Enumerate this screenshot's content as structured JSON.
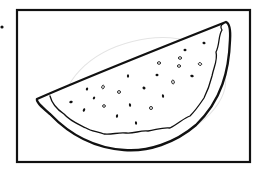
{
  "image": {
    "title": "",
    "subject": "watermelon-slice-line-drawing",
    "width": 262,
    "height": 170,
    "background_color": "#ffffff",
    "ink_color": "#111111",
    "faint_color": "#e4e4e4"
  },
  "frame": {
    "x": 17,
    "y": 10,
    "width": 233,
    "height": 152,
    "stroke_width": 2.2
  },
  "stray_dot": {
    "cx": 2,
    "cy": 27,
    "r": 1.6
  },
  "background_ellipse": {
    "cx": 145,
    "cy": 92,
    "rx": 82,
    "ry": 52,
    "rotate": -14
  },
  "watermelon": {
    "outer_path": "M37,99 C80,80 150,52 226,22 Q231,24 230,40 C229,70 222,100 196,125 C175,143 148,152 124,150 C96,148 70,135 50,114 C42,107 36,102 37,99 Z",
    "inner_rind_path": "M50,96 C52,104 58,110 64,114 C70,121 78,124 86,128 C92,132 98,131 104,134 C112,135 118,132 126,133 C134,134 140,130 148,131 C156,130 162,127 170,128 C178,124 184,118 190,116 C196,110 200,104 204,98 C208,90 210,84 212,76 C214,66 218,60 216,52 C220,44 218,36 222,30 C220,27 221,25 223,24"
  },
  "seeds": [
    {
      "cx": 204,
      "cy": 43,
      "rx": 1.6,
      "ry": 1.2,
      "rot": 20,
      "open": false
    },
    {
      "cx": 185,
      "cy": 50,
      "rx": 1.5,
      "ry": 1.2,
      "rot": 0,
      "open": false
    },
    {
      "cx": 180,
      "cy": 58,
      "rx": 1.6,
      "ry": 1.3,
      "rot": 0,
      "open": true
    },
    {
      "cx": 159,
      "cy": 63,
      "rx": 1.6,
      "ry": 1.3,
      "rot": 0,
      "open": true
    },
    {
      "cx": 179,
      "cy": 66,
      "rx": 1.6,
      "ry": 1.3,
      "rot": 0,
      "open": true
    },
    {
      "cx": 200,
      "cy": 64,
      "rx": 1.7,
      "ry": 1.3,
      "rot": 20,
      "open": true
    },
    {
      "cx": 128,
      "cy": 76,
      "rx": 1.1,
      "ry": 1.8,
      "rot": 0,
      "open": false
    },
    {
      "cx": 157,
      "cy": 75,
      "rx": 1.5,
      "ry": 1.2,
      "rot": 0,
      "open": false
    },
    {
      "cx": 192,
      "cy": 76,
      "rx": 1.8,
      "ry": 1.2,
      "rot": 20,
      "open": false
    },
    {
      "cx": 173,
      "cy": 82,
      "rx": 1.3,
      "ry": 1.9,
      "rot": -10,
      "open": true
    },
    {
      "cx": 144,
      "cy": 88,
      "rx": 1.6,
      "ry": 1.3,
      "rot": 30,
      "open": false
    },
    {
      "cx": 87,
      "cy": 89,
      "rx": 1.1,
      "ry": 1.6,
      "rot": 20,
      "open": false
    },
    {
      "cx": 103,
      "cy": 87,
      "rx": 1.2,
      "ry": 1.8,
      "rot": 15,
      "open": true
    },
    {
      "cx": 119,
      "cy": 92,
      "rx": 1.5,
      "ry": 1.4,
      "rot": 0,
      "open": true
    },
    {
      "cx": 163,
      "cy": 96,
      "rx": 1.1,
      "ry": 1.8,
      "rot": -10,
      "open": false
    },
    {
      "cx": 94,
      "cy": 98,
      "rx": 1.1,
      "ry": 1.5,
      "rot": 30,
      "open": false
    },
    {
      "cx": 71,
      "cy": 102,
      "rx": 1.8,
      "ry": 1.2,
      "rot": -20,
      "open": false
    },
    {
      "cx": 104,
      "cy": 106,
      "rx": 1.4,
      "ry": 1.3,
      "rot": 0,
      "open": true
    },
    {
      "cx": 130,
      "cy": 105,
      "rx": 1.1,
      "ry": 1.8,
      "rot": -10,
      "open": false
    },
    {
      "cx": 151,
      "cy": 108,
      "rx": 1.5,
      "ry": 1.5,
      "rot": 0,
      "open": true
    },
    {
      "cx": 84,
      "cy": 110,
      "rx": 1.1,
      "ry": 1.8,
      "rot": 25,
      "open": false
    },
    {
      "cx": 117,
      "cy": 116,
      "rx": 1.1,
      "ry": 1.8,
      "rot": 10,
      "open": false
    },
    {
      "cx": 136,
      "cy": 123,
      "rx": 1.1,
      "ry": 1.8,
      "rot": -5,
      "open": false
    }
  ]
}
